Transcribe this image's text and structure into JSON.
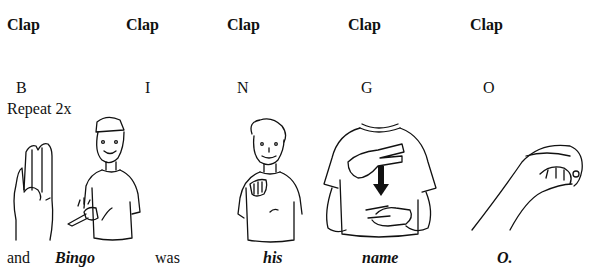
{
  "clap_row": [
    "Clap",
    "Clap",
    "Clap",
    "Clap",
    "Clap"
  ],
  "letters": [
    "B",
    "I",
    "N",
    "G",
    "O"
  ],
  "repeat_note": "Repeat 2x",
  "lyrics": [
    {
      "text": "and",
      "style": "normal"
    },
    {
      "text": "Bingo",
      "style": "bold-italic"
    },
    {
      "text": "was",
      "style": "normal"
    },
    {
      "text": "his",
      "style": "bold-italic"
    },
    {
      "text": "name",
      "style": "bold-italic"
    },
    {
      "text": "O.",
      "style": "bold-italic"
    }
  ],
  "illustrations": [
    {
      "name": "hand-sign-b",
      "description": "hand fingerspelling B"
    },
    {
      "name": "person-signing-bingo",
      "description": "boy with cap snapping fingers"
    },
    {
      "name": "person-signing-his",
      "description": "boy pointing palm outward"
    },
    {
      "name": "person-signing-name",
      "description": "torso with two-finger tap and down arrow"
    },
    {
      "name": "hand-sign-o",
      "description": "hand fingerspelling O"
    }
  ]
}
